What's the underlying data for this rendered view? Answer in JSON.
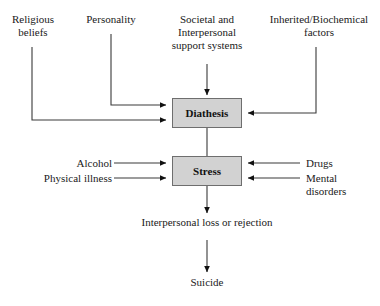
{
  "diagram": {
    "colors": {
      "box_fill": "#d2d2d2",
      "box_border": "#6e6e6e",
      "line": "#3a3a3a",
      "text": "#1a1a1a",
      "background": "#ffffff"
    },
    "nodes": {
      "religious_beliefs": "Religious\nbeliefs",
      "personality": "Personality",
      "societal_support": "Societal and\nInterpersonal\nsupport systems",
      "inherited_factors": "Inherited/Biochemical\nfactors",
      "diathesis": "Diathesis",
      "alcohol": "Alcohol",
      "physical_illness": "Physical illness",
      "stress": "Stress",
      "drugs": "Drugs",
      "mental_disorders": "Mental\ndisorders",
      "interpersonal_loss": "Interpersonal loss or rejection",
      "suicide": "Suicide"
    },
    "edges": [
      {
        "from": "religious_beliefs",
        "to": "diathesis",
        "style": "elbow-down-right",
        "arrow": true
      },
      {
        "from": "personality",
        "to": "diathesis",
        "style": "elbow-down-right",
        "arrow": true
      },
      {
        "from": "societal_support",
        "to": "diathesis",
        "style": "straight-down",
        "arrow": true
      },
      {
        "from": "inherited_factors",
        "to": "diathesis",
        "style": "elbow-down-left",
        "arrow": true
      },
      {
        "from": "diathesis",
        "to": "stress",
        "style": "straight-down",
        "arrow": false
      },
      {
        "from": "alcohol",
        "to": "stress",
        "style": "straight-right",
        "arrow": true
      },
      {
        "from": "physical_illness",
        "to": "stress",
        "style": "straight-right",
        "arrow": true
      },
      {
        "from": "drugs",
        "to": "stress",
        "style": "straight-left",
        "arrow": true
      },
      {
        "from": "mental_disorders",
        "to": "stress",
        "style": "straight-left",
        "arrow": true
      },
      {
        "from": "stress",
        "to": "interpersonal_loss",
        "style": "straight-down",
        "arrow": true
      },
      {
        "from": "interpersonal_loss",
        "to": "suicide",
        "style": "straight-down",
        "arrow": true
      }
    ]
  }
}
